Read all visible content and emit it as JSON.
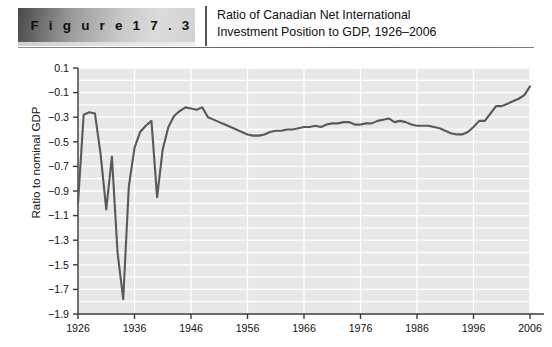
{
  "figure": {
    "banner_label": "F i g u r e   1 7 . 3",
    "title_line1": "Ratio of Canadian Net International",
    "title_line2": "Investment Position to GDP, 1926–2006"
  },
  "chart_data": {
    "type": "line",
    "title": "Ratio of Canadian Net International Investment Position to GDP, 1926–2006",
    "xlabel": "",
    "ylabel": "Ratio to nominal GDP",
    "xlim": [
      1926,
      2006
    ],
    "ylim": [
      -1.9,
      0.1
    ],
    "grid": true,
    "legend": "none",
    "line_color": "#595959",
    "plot_background": "#e8e8e8",
    "gridline_color": "#ffffff",
    "x_ticks": [
      1926,
      1936,
      1946,
      1956,
      1966,
      1976,
      1986,
      1996,
      2006
    ],
    "x_tick_labels": [
      "1926",
      "1936",
      "1946",
      "1956",
      "1966",
      "1976",
      "1986",
      "1996",
      "2006"
    ],
    "y_ticks": [
      0.1,
      -0.1,
      -0.3,
      -0.5,
      -0.7,
      -0.9,
      -1.1,
      -1.3,
      -1.5,
      -1.7,
      -1.9
    ],
    "y_tick_labels": [
      "0.1",
      "−0.1",
      "−0.3",
      "−0.5",
      "−0.7",
      "−0.9",
      "−1.1",
      "−1.3",
      "−1.5",
      "−1.7",
      "−1.9"
    ],
    "series": [
      {
        "name": "Ratio of Canadian NIIP to GDP",
        "x": [
          1926,
          1927,
          1928,
          1929,
          1930,
          1931,
          1932,
          1933,
          1934,
          1935,
          1936,
          1937,
          1938,
          1939,
          1940,
          1941,
          1942,
          1943,
          1944,
          1945,
          1946,
          1947,
          1948,
          1949,
          1950,
          1951,
          1952,
          1953,
          1954,
          1955,
          1956,
          1957,
          1958,
          1959,
          1960,
          1961,
          1962,
          1963,
          1964,
          1965,
          1966,
          1967,
          1968,
          1969,
          1970,
          1971,
          1972,
          1973,
          1974,
          1975,
          1976,
          1977,
          1978,
          1979,
          1980,
          1981,
          1982,
          1983,
          1984,
          1985,
          1986,
          1987,
          1988,
          1989,
          1990,
          1991,
          1992,
          1993,
          1994,
          1995,
          1996,
          1997,
          1998,
          1999,
          2000,
          2001,
          2002,
          2003,
          2004,
          2005,
          2006
        ],
        "values": [
          -1.0,
          -0.28,
          -0.26,
          -0.27,
          -0.6,
          -1.05,
          -0.62,
          -1.4,
          -1.78,
          -0.86,
          -0.55,
          -0.42,
          -0.37,
          -0.33,
          -0.95,
          -0.56,
          -0.38,
          -0.29,
          -0.25,
          -0.22,
          -0.23,
          -0.24,
          -0.22,
          -0.3,
          -0.32,
          -0.34,
          -0.36,
          -0.38,
          -0.4,
          -0.42,
          -0.44,
          -0.45,
          -0.45,
          -0.44,
          -0.42,
          -0.41,
          -0.41,
          -0.4,
          -0.4,
          -0.39,
          -0.38,
          -0.38,
          -0.37,
          -0.38,
          -0.36,
          -0.35,
          -0.35,
          -0.34,
          -0.34,
          -0.36,
          -0.36,
          -0.35,
          -0.35,
          -0.33,
          -0.32,
          -0.31,
          -0.34,
          -0.33,
          -0.34,
          -0.36,
          -0.37,
          -0.37,
          -0.37,
          -0.38,
          -0.39,
          -0.41,
          -0.43,
          -0.44,
          -0.44,
          -0.42,
          -0.38,
          -0.33,
          -0.33,
          -0.27,
          -0.21,
          -0.21,
          -0.19,
          -0.17,
          -0.15,
          -0.12,
          -0.05
        ]
      }
    ]
  }
}
